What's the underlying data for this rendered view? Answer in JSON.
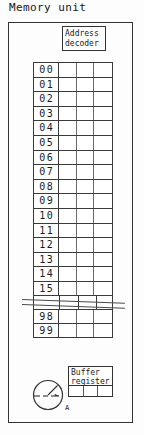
{
  "diagram": {
    "title": "Memory unit",
    "frame_label": "memory-unit-frame",
    "decoder": {
      "line1": "Address",
      "line2": "decoder"
    },
    "matrix": {
      "data_columns": 3,
      "rows": [
        {
          "address": "00"
        },
        {
          "address": "01"
        },
        {
          "address": "02"
        },
        {
          "address": "03"
        },
        {
          "address": "04"
        },
        {
          "address": "05"
        },
        {
          "address": "06"
        },
        {
          "address": "07"
        },
        {
          "address": "08"
        },
        {
          "address": "09"
        },
        {
          "address": "10"
        },
        {
          "address": "11"
        },
        {
          "address": "12"
        },
        {
          "address": "13"
        },
        {
          "address": "14"
        },
        {
          "address": "15"
        }
      ],
      "tail_rows": [
        {
          "address": "98"
        },
        {
          "address": "99"
        }
      ]
    },
    "buffer_register": {
      "line1": "Buffer",
      "line2": "register",
      "cells": 3
    },
    "access_symbol": {
      "name": "dial-pointer-icon",
      "label": "A"
    },
    "colors": {
      "ink": "#1a1a1a",
      "rule": "#3a3a3a",
      "inner_rule": "#6a6a6a",
      "paper": "#fdfdfd"
    }
  }
}
